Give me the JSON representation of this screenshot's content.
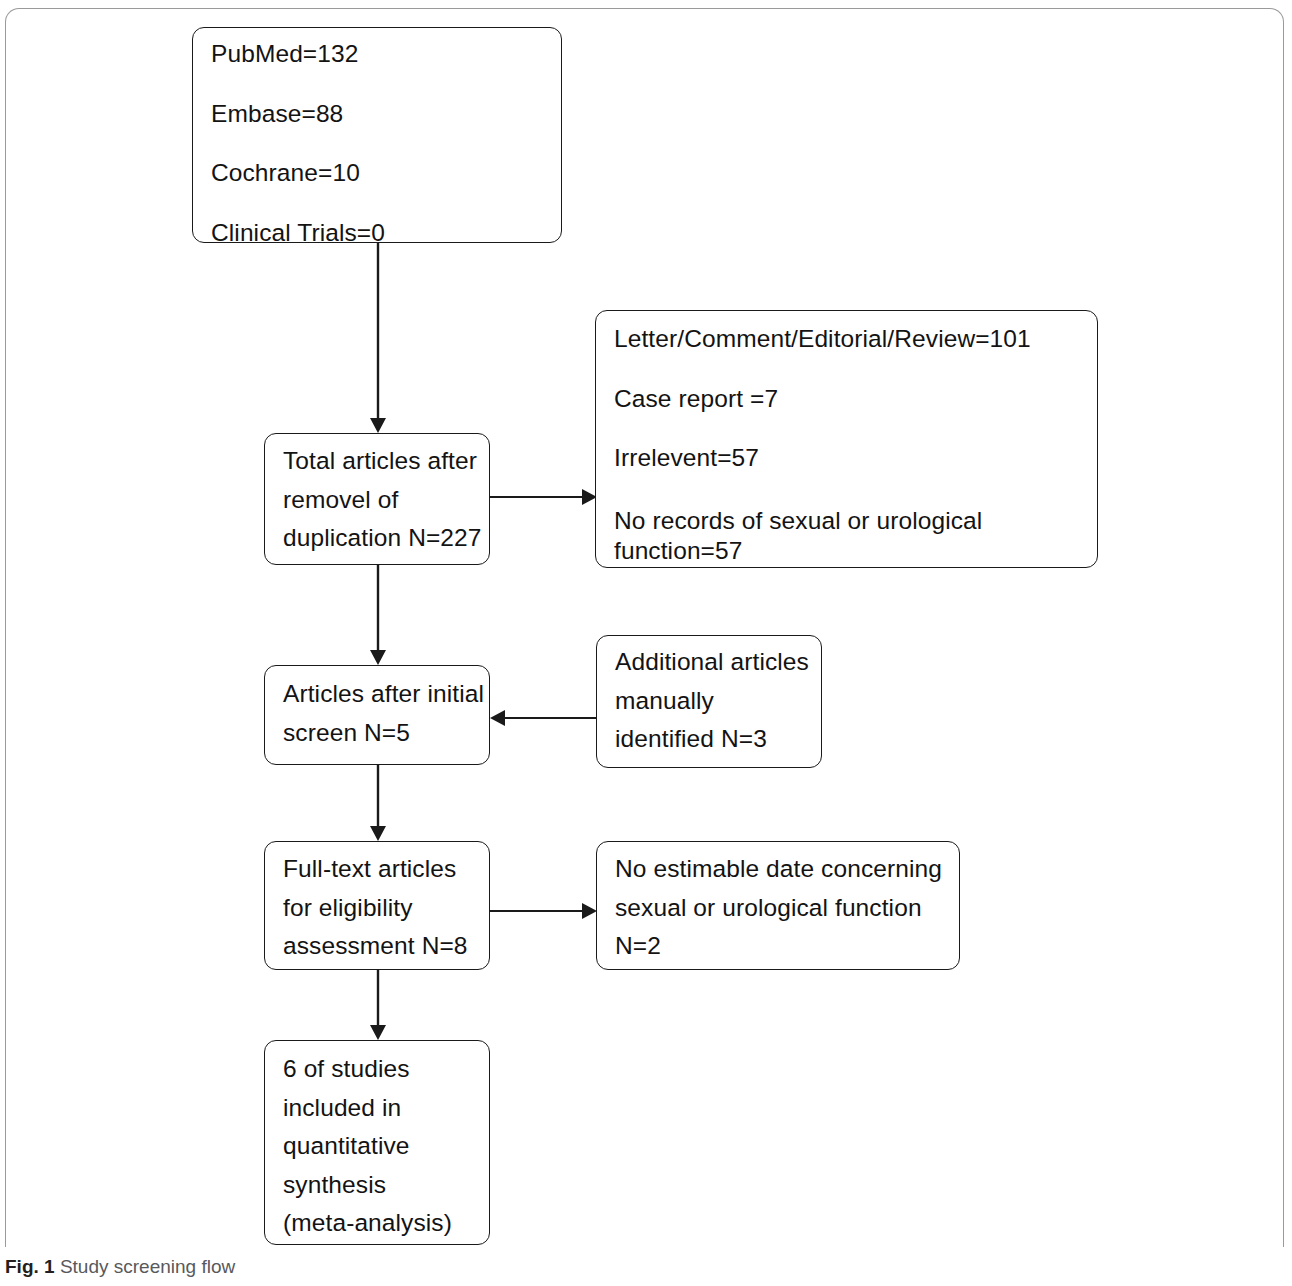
{
  "figure": {
    "caption_label": "Fig. 1",
    "caption_text": "Study screening flow"
  },
  "flow": {
    "nodes": {
      "sources": {
        "name": "database-search-results",
        "lines": [
          "PubMed=132",
          "Embase=88",
          "Cochrane=10",
          "Clinical Trials=0"
        ]
      },
      "deduplicated": {
        "name": "total-articles-after-removal-of-duplication",
        "lines": [
          "Total articles after",
          "removel of",
          "duplication N=227"
        ]
      },
      "excluded_screening": {
        "name": "excluded-at-screening",
        "lines": [
          "Letter/Comment/Editorial/Review=101",
          "Case report =7",
          "Irrelevent=57",
          "No records of sexual or urological function=57"
        ]
      },
      "after_initial_screen": {
        "name": "articles-after-initial-screen",
        "lines": [
          "Articles after initial",
          "screen N=5"
        ]
      },
      "manual_additions": {
        "name": "additional-articles-manually-identified",
        "lines": [
          "Additional articles",
          "manually",
          "identified N=3"
        ]
      },
      "full_text": {
        "name": "full-text-articles-for-eligibility-assessment",
        "lines": [
          "Full-text articles",
          "for eligibility",
          "assessment N=8"
        ]
      },
      "excluded_eligibility": {
        "name": "excluded-no-estimable-data",
        "lines": [
          "No estimable date concerning",
          "sexual or urological function",
          "N=2"
        ]
      },
      "included": {
        "name": "studies-included-in-quantitative-synthesis",
        "lines": [
          "6 of studies",
          "included in",
          "quantitative",
          "synthesis",
          "(meta-analysis)"
        ]
      }
    },
    "edges": [
      {
        "id": "sources-to-dedup",
        "from": "sources",
        "to": "deduplicated",
        "direction": "down"
      },
      {
        "id": "dedup-to-excluded-screening",
        "from": "deduplicated",
        "to": "excluded_screening",
        "direction": "right"
      },
      {
        "id": "dedup-to-initial-screen",
        "from": "deduplicated",
        "to": "after_initial_screen",
        "direction": "down"
      },
      {
        "id": "manual-to-initial-screen",
        "from": "manual_additions",
        "to": "after_initial_screen",
        "direction": "left"
      },
      {
        "id": "initial-screen-to-full-text",
        "from": "after_initial_screen",
        "to": "full_text",
        "direction": "down"
      },
      {
        "id": "full-text-to-excluded-eligibility",
        "from": "full_text",
        "to": "excluded_eligibility",
        "direction": "right"
      },
      {
        "id": "full-text-to-included",
        "from": "full_text",
        "to": "included",
        "direction": "down"
      }
    ]
  },
  "colors": {
    "stroke": "#1a1a1a",
    "frame": "#9a9a9a",
    "text": "#131313",
    "caption_text": "#58595b",
    "caption_label": "#231f20",
    "background": "#ffffff"
  }
}
